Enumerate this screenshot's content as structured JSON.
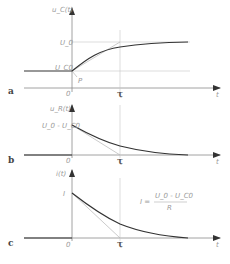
{
  "panels": [
    {
      "id": "a",
      "panel_label": "a",
      "y_label": "u_C(t)",
      "x_label": "t",
      "origin_label": "0",
      "tau_label": "τ",
      "levels": {
        "top": "U_0",
        "start": "U_C0"
      },
      "point_label": "P",
      "curve": "rising exponential from U_C0 approaching U_0"
    },
    {
      "id": "b",
      "panel_label": "b",
      "y_label": "u_R(t)",
      "x_label": "t",
      "origin_label": "0",
      "tau_label": "τ",
      "levels": {
        "start": "U_0 - U_C0"
      },
      "curve": "decaying exponential from U_0 - U_C0 to 0"
    },
    {
      "id": "c",
      "panel_label": "c",
      "y_label": "i(t)",
      "x_label": "t",
      "origin_label": "0",
      "tau_label": "τ",
      "levels": {
        "start": "I"
      },
      "formula": {
        "lhs": "I =",
        "numerator": "U_0 - U_C0",
        "denominator": "R"
      },
      "curve": "decaying exponential from I to 0"
    }
  ]
}
